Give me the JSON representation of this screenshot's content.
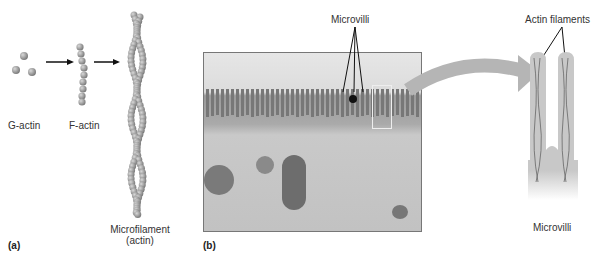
{
  "panel_a": {
    "label": "(a)",
    "g_actin": "G-actin",
    "f_actin": "F-actin",
    "microfilament_line1": "Microfilament",
    "microfilament_line2": "(actin)"
  },
  "panel_b": {
    "label": "(b)",
    "micrograph_callout": "Microvilli",
    "diagram_callout": "Actin filaments",
    "diagram_caption": "Microvilli"
  },
  "colors": {
    "bead": "#9a9a9a",
    "arrow": "#111111",
    "curved_arrow": "#b5b5b5",
    "villus_fill": "#c8c8c8"
  }
}
